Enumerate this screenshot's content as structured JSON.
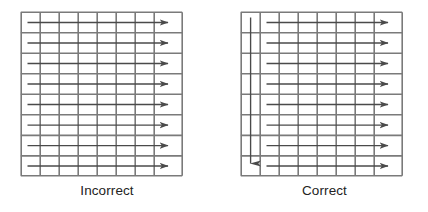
{
  "figures": [
    {
      "caption": "Incorrect",
      "id": "incorrect-diagram",
      "grid": {
        "columns": 8,
        "rows": 8,
        "last_column_wider": true,
        "line_color": "#7a7a7a",
        "cell_fill": "#ffffff"
      },
      "arrows": {
        "horizontal": {
          "count": 8,
          "direction": "right",
          "color": "#4a4a4a",
          "start_column": 1,
          "start_fraction_into_column": 0.35,
          "description": "one horizontal arrow per row, starting inside the first column and ending with an arrowhead in the last column"
        },
        "vertical": {
          "count": 0,
          "description": "no vertical reinforcement arrow present"
        }
      }
    },
    {
      "caption": "Correct",
      "id": "correct-diagram",
      "grid": {
        "columns": 8,
        "rows": 8,
        "last_column_wider": true,
        "line_color": "#7a7a7a",
        "cell_fill": "#ffffff"
      },
      "arrows": {
        "horizontal": {
          "count": 8,
          "direction": "right",
          "color": "#4a4a4a",
          "start_column": 2,
          "start_fraction_into_column": 0.3,
          "description": "one horizontal arrow per row, starting inside the second column and ending with an arrowhead in the last column"
        },
        "vertical": {
          "count": 1,
          "direction": "down",
          "color": "#4a4a4a",
          "column": 1,
          "description": "single vertical arrow running down the centre of the first column, arrowhead in the bottom row"
        }
      }
    }
  ]
}
